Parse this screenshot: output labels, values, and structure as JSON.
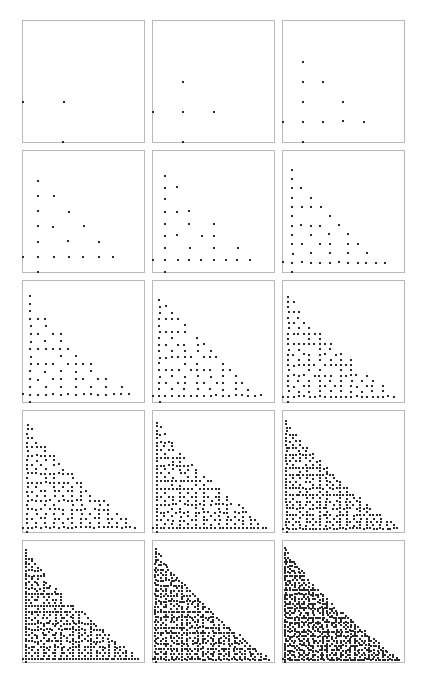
{
  "figure": {
    "type": "scatter-panel-grid",
    "rows": 5,
    "columns": 3,
    "panel_count": 15,
    "background_color": "#ffffff",
    "panel_border_color": "#b9b9bd",
    "dot_color": "#2b2b2b",
    "dot_size_px": 2,
    "panel_size_px": 123,
    "gap_px": 7,
    "origin_x_px": 22,
    "origin_y_px": 20
  },
  "header": {
    "faint_line_1": "",
    "faint_line_2": ""
  },
  "chart_data": {
    "type": "scatter",
    "title": "",
    "subtitle": "",
    "xlabel": "",
    "ylabel": "",
    "grid": false,
    "legend": null,
    "axis_origin": "bottom-left",
    "xlim": [
      0,
      1
    ],
    "ylim": [
      0,
      1
    ],
    "panel_order": "row-major",
    "panels": [
      {
        "index": 1,
        "row": 1,
        "col": 1,
        "N": 3,
        "point_count": 5,
        "label": ""
      },
      {
        "index": 2,
        "row": 1,
        "col": 2,
        "N": 4,
        "point_count": 9,
        "label": ""
      },
      {
        "index": 3,
        "row": 1,
        "col": 3,
        "N": 6,
        "point_count": 15,
        "label": ""
      },
      {
        "index": 4,
        "row": 2,
        "col": 1,
        "N": 8,
        "point_count": 23,
        "label": ""
      },
      {
        "index": 5,
        "row": 2,
        "col": 2,
        "N": 10,
        "point_count": 33,
        "label": ""
      },
      {
        "index": 6,
        "row": 2,
        "col": 3,
        "N": 13,
        "point_count": 50,
        "label": ""
      },
      {
        "index": 7,
        "row": 3,
        "col": 1,
        "N": 16,
        "point_count": 71,
        "label": ""
      },
      {
        "index": 8,
        "row": 3,
        "col": 2,
        "N": 19,
        "point_count": 94,
        "label": ""
      },
      {
        "index": 9,
        "row": 3,
        "col": 3,
        "N": 23,
        "point_count": 128,
        "label": ""
      },
      {
        "index": 10,
        "row": 4,
        "col": 1,
        "N": 27,
        "point_count": 166,
        "label": ""
      },
      {
        "index": 11,
        "row": 4,
        "col": 2,
        "N": 31,
        "point_count": 208,
        "label": ""
      },
      {
        "index": 12,
        "row": 4,
        "col": 3,
        "N": 36,
        "point_count": 266,
        "label": ""
      },
      {
        "index": 13,
        "row": 5,
        "col": 1,
        "N": 41,
        "point_count": 330,
        "label": ""
      },
      {
        "index": 14,
        "row": 5,
        "col": 2,
        "N": 46,
        "point_count": 400,
        "label": ""
      },
      {
        "index": 15,
        "row": 5,
        "col": 3,
        "N": 52,
        "point_count": 490,
        "label": ""
      }
    ],
    "boundary": {
      "family": "convex-decreasing",
      "rule": "j <= N * (1 - (i/N)^p) with p about 0.75, plus coprime(i,j) visibility filter"
    }
  }
}
